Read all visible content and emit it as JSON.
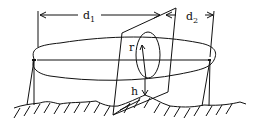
{
  "diagram": {
    "type": "fresnel-zone-geometry",
    "labels": {
      "d1": {
        "base": "d",
        "sub": "1"
      },
      "d2": {
        "base": "d",
        "sub": "2"
      },
      "r": "r",
      "h": "h"
    },
    "colors": {
      "ink": "#111111",
      "background": "#ffffff"
    }
  }
}
